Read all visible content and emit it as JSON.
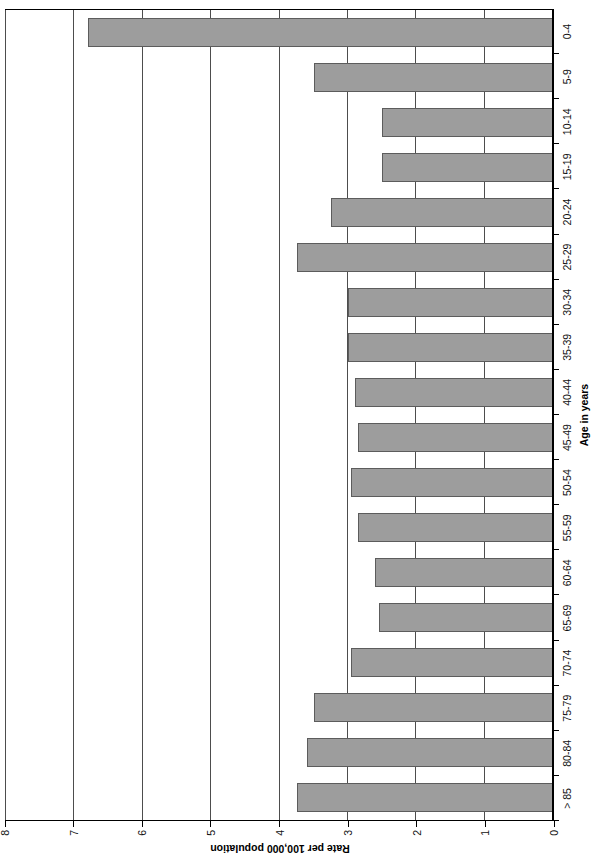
{
  "chart_data": {
    "type": "bar",
    "title": "",
    "orientation": "vertical-rotated-page",
    "xlabel": "Age in years",
    "ylabel": "Rate per 100,000 population",
    "categories": [
      "0-4",
      "5-9",
      "10-14",
      "15-19",
      "20-24",
      "25-29",
      "30-34",
      "35-39",
      "40-44",
      "45-49",
      "50-54",
      "55-59",
      "60-64",
      "65-69",
      "70-74",
      "75-79",
      "80-84",
      "> 85"
    ],
    "values": [
      6.8,
      3.5,
      2.5,
      2.5,
      3.25,
      3.75,
      3.0,
      3.0,
      2.9,
      2.85,
      2.95,
      2.85,
      2.6,
      2.55,
      2.95,
      3.5,
      3.6,
      3.75
    ],
    "ylim": [
      0,
      8
    ],
    "yticks": [
      0,
      1,
      2,
      3,
      4,
      5,
      6,
      7,
      8
    ],
    "ytick_labels": [
      "0",
      "1",
      "2",
      "3",
      "4",
      "5",
      "6",
      "7",
      "8"
    ],
    "grid": "horizontal-value-gridlines",
    "legend": null,
    "bar_fill_color": "#9d9d9d",
    "bar_border_color": "#5c5c5c",
    "axis_color": "#000000",
    "gridline_color": "#4d4d4d"
  }
}
